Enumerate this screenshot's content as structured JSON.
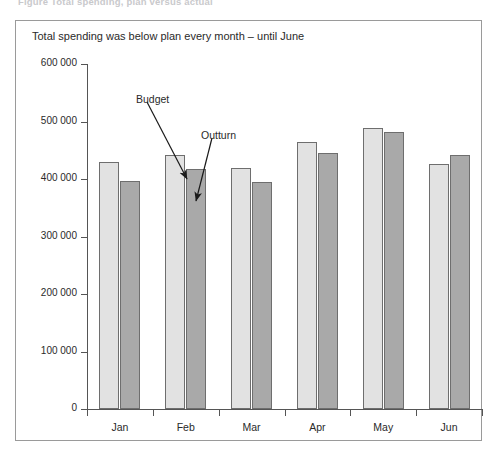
{
  "figure": {
    "caption": "Figure    Total spending, plan versus actual",
    "title": "Total spending was below plan every month – until June"
  },
  "annotations": [
    {
      "name": "budget",
      "label": "Budget",
      "x": 120,
      "y": 72,
      "arrow": {
        "x1": 131,
        "y1": 81,
        "x2": 171,
        "y2": 158
      }
    },
    {
      "name": "outturn",
      "label": "Outturn",
      "x": 185,
      "y": 108,
      "arrow": {
        "x1": 196,
        "y1": 117,
        "x2": 180,
        "y2": 180
      }
    }
  ],
  "axes": {
    "y_ticks": [
      "600 000",
      "500 000",
      "400 000",
      "300 000",
      "200 000",
      "100 000",
      "0"
    ],
    "x_labels": [
      "Jan",
      "Feb",
      "Mar",
      "Apr",
      "May",
      "Jun"
    ]
  },
  "colors": {
    "budget": "#e2e2e2",
    "outturn": "#a9a9a9",
    "bar_border": "#6e6e6e",
    "axis": "#555555",
    "frame": "#9a9a9a"
  },
  "chart_data": {
    "type": "bar",
    "title": "Total spending was below plan every month – until June",
    "xlabel": "",
    "ylabel": "",
    "categories": [
      "Jan",
      "Feb",
      "Mar",
      "Apr",
      "May",
      "Jun"
    ],
    "series": [
      {
        "name": "Budget",
        "values": [
          429000,
          442000,
          419000,
          464000,
          488000,
          426000
        ]
      },
      {
        "name": "Outturn",
        "values": [
          397000,
          417000,
          395000,
          446000,
          481000,
          441000
        ]
      }
    ],
    "ylim": [
      0,
      600000
    ],
    "ytick_step": 100000,
    "ytick_labels": [
      "0",
      "100 000",
      "200 000",
      "300 000",
      "400 000",
      "500 000",
      "600 000"
    ],
    "grid": false,
    "legend": "none (series identified by callout annotations)",
    "annotations": [
      "Budget",
      "Outturn"
    ]
  }
}
